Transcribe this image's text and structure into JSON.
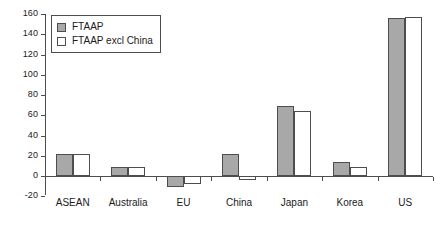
{
  "chart_data": {
    "type": "bar",
    "title": "",
    "subtitle": "",
    "xlabel": "",
    "ylabel": "",
    "categories": [
      "ASEAN",
      "Australia",
      "EU",
      "China",
      "Japan",
      "Korea",
      "US"
    ],
    "series": [
      {
        "name": "FTAAP",
        "color": "#a8a8a8",
        "values": [
          22,
          9,
          -11,
          22,
          69,
          14,
          156
        ]
      },
      {
        "name": "FTAAP excl China",
        "color": "#ffffff",
        "values": [
          22,
          9,
          -8,
          -4,
          64,
          9,
          157
        ]
      }
    ],
    "ylim": [
      -20,
      160
    ],
    "ytick_step": 20,
    "yticks": [
      160,
      140,
      120,
      100,
      80,
      60,
      40,
      20,
      0,
      -20
    ],
    "ytick_labels": [
      "160",
      "140",
      "120",
      "100",
      "80",
      "60",
      "40",
      "20",
      "0",
      "-20"
    ],
    "grid": false,
    "legend_position": "top-left",
    "axis_color": "#4d4d4d",
    "bar_edge_color": "#4d4d4d",
    "background": "#ffffff"
  },
  "legend": {
    "entries": [
      {
        "label": "FTAAP",
        "swatch": "gray-filled-square"
      },
      {
        "label": "FTAAP excl China",
        "swatch": "white-outlined-square"
      }
    ]
  }
}
